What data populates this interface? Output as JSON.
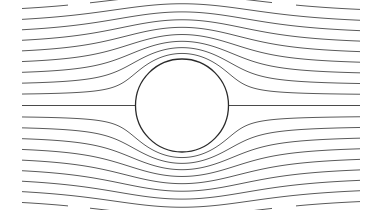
{
  "diagram": {
    "type": "potential-flow-around-cylinder",
    "width": 378,
    "height": 210,
    "cylinder": {
      "cx": 182,
      "cy": 105.5,
      "r": 46.5,
      "stroke": "#2a2a2a"
    },
    "flow": {
      "x_start": 22,
      "x_end": 360,
      "line_color": "#5a5a5a",
      "stagnation_line_y": 105.5,
      "streamline_offsets": [
        -91,
        -80.5,
        -70.5,
        -60.5,
        -50.5,
        -40.5,
        -30.5,
        -20.5,
        -10.5,
        10.5,
        20.5,
        30.5,
        40.5,
        50.5,
        60.5,
        70.5,
        80.5,
        91
      ],
      "outer_segments": [
        {
          "edge": "top",
          "x_ranges": [
            [
              22,
              68
            ],
            [
              90,
              132
            ],
            [
              230,
              272
            ],
            [
              296,
              360
            ]
          ]
        },
        {
          "edge": "bottom",
          "x_ranges": [
            [
              22,
              68
            ],
            [
              90,
              132
            ],
            [
              230,
              272
            ],
            [
              296,
              360
            ]
          ]
        }
      ]
    }
  }
}
